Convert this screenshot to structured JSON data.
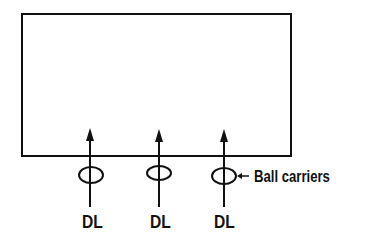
{
  "diagram": {
    "colors": {
      "stroke": "#111111",
      "background": "#ffffff"
    },
    "box": {
      "x": 22,
      "y": 14,
      "width": 269,
      "height": 142
    },
    "players": [
      {
        "role": "DL",
        "label": "DL",
        "x": 90
      },
      {
        "role": "DL",
        "label": "DL",
        "x": 159
      },
      {
        "role": "DL",
        "label": "DL",
        "x": 224
      }
    ],
    "ball_carrier_ellipse": {
      "cy": 175,
      "rx": 12,
      "ry": 8
    },
    "annotation": {
      "label": "Ball carriers",
      "pointer": "left-arrow"
    }
  }
}
